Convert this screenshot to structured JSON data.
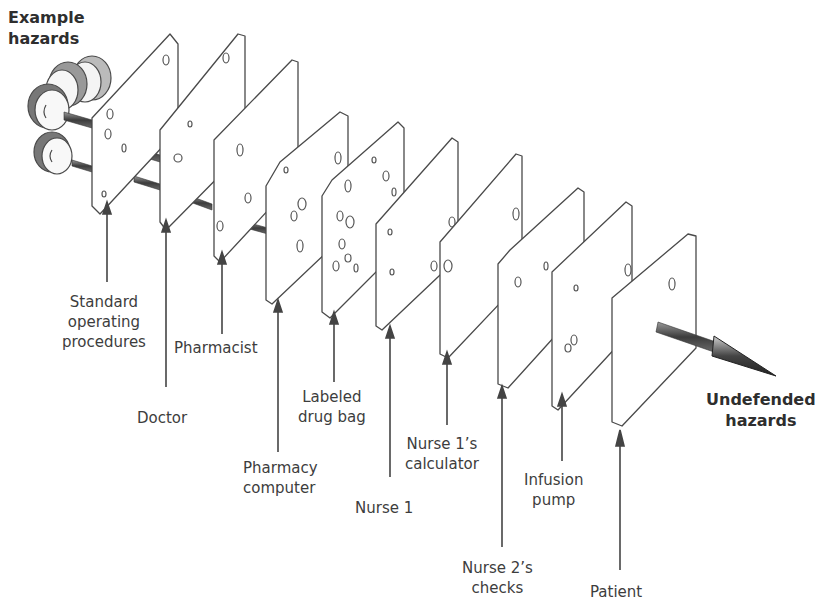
{
  "diagram": {
    "type": "swiss-cheese-model",
    "colors": {
      "background": "#ffffff",
      "ink": "#4a4a4a",
      "shading": "#555555",
      "text": "#3d3d3d"
    },
    "source_label": {
      "line1": "Example",
      "line2": "hazards"
    },
    "sink_label": {
      "line1": "Undefended",
      "line2": "hazards"
    },
    "layers": [
      {
        "label_lines": [
          "Standard",
          "operating",
          "procedures"
        ]
      },
      {
        "label_lines": [
          "Doctor"
        ]
      },
      {
        "label_lines": [
          "Pharmacist"
        ]
      },
      {
        "label_lines": [
          "Pharmacy",
          "computer"
        ]
      },
      {
        "label_lines": [
          "Labeled",
          "drug bag"
        ]
      },
      {
        "label_lines": [
          "Nurse 1"
        ]
      },
      {
        "label_lines": [
          "Nurse 1’s",
          "calculator"
        ]
      },
      {
        "label_lines": [
          "Nurse 2’s",
          "checks"
        ]
      },
      {
        "label_lines": [
          "Infusion",
          "pump"
        ]
      },
      {
        "label_lines": [
          "Patient"
        ]
      }
    ],
    "hazard_count": 4
  }
}
